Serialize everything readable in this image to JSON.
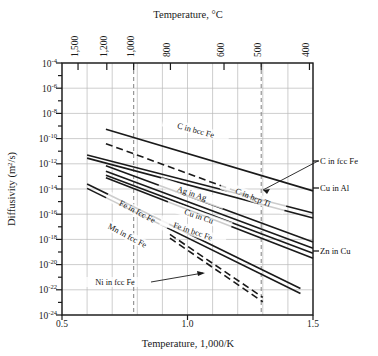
{
  "chart_data": {
    "type": "line",
    "title": "",
    "xlabel": "Temperature, 1,000/K",
    "ylabel": "Diffusivity (m²/s)",
    "top_axis_label": "Temperature, °C",
    "xlim": [
      0.5,
      1.5
    ],
    "ylim_exponents": [
      -24,
      -4
    ],
    "y_scale": "log10",
    "grid": true,
    "legend": "inline-labels",
    "x_ticks": [
      "0.5",
      "1.0",
      "1.5"
    ],
    "x_tick_values": [
      0.5,
      1.0,
      1.5
    ],
    "x_minor_step": 0.1,
    "y_ticks": [
      {
        "label": "10",
        "exp": "-4",
        "value": -4
      },
      {
        "label": "10",
        "exp": "-6",
        "value": -6
      },
      {
        "label": "10",
        "exp": "-8",
        "value": -8
      },
      {
        "label": "10",
        "exp": "-10",
        "value": -10
      },
      {
        "label": "10",
        "exp": "-12",
        "value": -12
      },
      {
        "label": "10",
        "exp": "-14",
        "value": -14
      },
      {
        "label": "10",
        "exp": "-16",
        "value": -16
      },
      {
        "label": "10",
        "exp": "-18",
        "value": -18
      },
      {
        "label": "10",
        "exp": "-20",
        "value": -20
      },
      {
        "label": "10",
        "exp": "-22",
        "value": -22
      },
      {
        "label": "10",
        "exp": "-24",
        "value": -24
      }
    ],
    "top_ticks": [
      {
        "label": "1,500",
        "celsius": 1500,
        "x": 0.5639
      },
      {
        "label": "1,200",
        "celsius": 1200,
        "x": 0.6785
      },
      {
        "label": "1,000",
        "celsius": 1000,
        "x": 0.7855
      },
      {
        "label": "800",
        "celsius": 800,
        "x": 0.932
      },
      {
        "label": "600",
        "celsius": 600,
        "x": 1.1455
      },
      {
        "label": "500",
        "celsius": 500,
        "x": 1.2937
      },
      {
        "label": "400",
        "celsius": 400,
        "x": 1.4859
      }
    ],
    "reference_lines": [
      {
        "name": "1000C-dashed",
        "x": 0.7855,
        "style": "dashed"
      },
      {
        "name": "500C-dashed",
        "x": 1.2937,
        "style": "dashed"
      }
    ],
    "series": [
      {
        "name": "C in bcc Fe",
        "style": "solid",
        "label_position": "inline",
        "points": [
          [
            0.675,
            -9.25
          ],
          [
            1.5,
            -14.15
          ]
        ]
      },
      {
        "name": "C in fcc Fe",
        "style": "dashed",
        "label_position": "right",
        "points": [
          [
            0.675,
            -10.4
          ],
          [
            1.3,
            -14.95
          ]
        ]
      },
      {
        "name": "Cu in Al",
        "style": "solid",
        "label_position": "right",
        "points": [
          [
            0.6,
            -11.3
          ],
          [
            1.5,
            -15.9
          ]
        ]
      },
      {
        "name": "C in hcp Ti",
        "style": "solid",
        "label_position": "inline",
        "points": [
          [
            0.6,
            -11.55
          ],
          [
            1.5,
            -16.3
          ]
        ]
      },
      {
        "name": "Ag in Ag",
        "style": "solid",
        "label_position": "inline",
        "points": [
          [
            0.675,
            -12.15
          ],
          [
            1.5,
            -18.2
          ]
        ]
      },
      {
        "name": "Cu in Cu",
        "style": "solid",
        "label_position": "inline",
        "points": [
          [
            0.675,
            -12.6
          ],
          [
            1.5,
            -18.7
          ]
        ]
      },
      {
        "name": "Zn in Cu",
        "style": "solid",
        "label_position": "right",
        "points": [
          [
            0.675,
            -12.9
          ],
          [
            1.5,
            -19.1
          ]
        ]
      },
      {
        "name": "Fe in bcc Fe",
        "style": "solid",
        "label_position": "inline",
        "points": [
          [
            0.675,
            -13.1
          ],
          [
            1.5,
            -19.5
          ]
        ]
      },
      {
        "name": "Fe in fcc Fe",
        "style": "solid",
        "label_position": "inline",
        "points": [
          [
            0.6,
            -13.6
          ],
          [
            1.45,
            -21.9
          ]
        ]
      },
      {
        "name": "Mn in fcc Fe",
        "style": "solid",
        "label_position": "inline",
        "points": [
          [
            0.6,
            -13.95
          ],
          [
            1.45,
            -22.3
          ]
        ]
      },
      {
        "name": "Ni in fcc Fe",
        "style": "dashed",
        "label_position": "inline",
        "points": [
          [
            0.93,
            -17.6
          ],
          [
            1.3,
            -22.6
          ]
        ]
      },
      {
        "name": "Ni in fcc Fe (2)",
        "style": "dashed",
        "label_position": "none",
        "points": [
          [
            0.93,
            -17.9
          ],
          [
            1.3,
            -22.95
          ]
        ]
      }
    ],
    "curve_labels": [
      {
        "text": "C in bcc Fe",
        "x": 195,
        "y": 133,
        "rotate": 15
      },
      {
        "text": "Ag in Ag",
        "x": 191,
        "y": 196,
        "rotate": 19
      },
      {
        "text": "Cu in Cu",
        "x": 198,
        "y": 219,
        "rotate": 19
      },
      {
        "text": "C in hcp Ti",
        "x": 252,
        "y": 200,
        "rotate": 22
      },
      {
        "text": "Fe in bcc Fe",
        "x": 192,
        "y": 234,
        "rotate": 19
      },
      {
        "text": "Fe in fcc Fe",
        "x": 136,
        "y": 214,
        "rotate": 28
      },
      {
        "text": "Mn in fcc Fe",
        "x": 126,
        "y": 238,
        "rotate": 28
      },
      {
        "text": "Ni in fcc Fe",
        "x": 115,
        "y": 285,
        "rotate": 0
      }
    ],
    "right_labels": [
      {
        "text": "C in fcc Fe",
        "y": 164
      },
      {
        "text": "Cu in Al",
        "y": 191
      },
      {
        "text": "Zn in Cu",
        "y": 254
      }
    ]
  },
  "colors": {
    "axis": "#1a1a1a",
    "grid": "#b9b9b9",
    "curve": "#1a1a1a",
    "background": "#ffffff",
    "reference": "#8c8c8c"
  }
}
